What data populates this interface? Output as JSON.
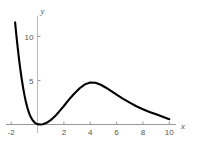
{
  "chart_data": {
    "type": "line",
    "title": "",
    "subtitle": "",
    "xlabel": "x",
    "ylabel": "y",
    "xlim": [
      -2.1,
      10.6
    ],
    "ylim": [
      -0.9,
      12.6
    ],
    "grid": false,
    "legend": null,
    "x_ticks": [
      {
        "value": -2,
        "label": "-2"
      },
      {
        "value": 2,
        "label": "2"
      },
      {
        "value": 4,
        "label": "4"
      },
      {
        "value": 6,
        "label": "6"
      },
      {
        "value": 8,
        "label": "8"
      },
      {
        "value": 10,
        "label": "10"
      }
    ],
    "y_ticks": [
      {
        "value": 5,
        "label": "5"
      },
      {
        "value": 10,
        "label": "10"
      }
    ],
    "series": [
      {
        "name": "curve",
        "color": "#000000",
        "line_width": 2.1,
        "x": [
          -1.7,
          -1.6,
          -1.5,
          -1.4,
          -1.3,
          -1.2,
          -1.1,
          -1.0,
          -0.9,
          -0.8,
          -0.7,
          -0.6,
          -0.5,
          -0.4,
          -0.3,
          -0.2,
          -0.1,
          0.0,
          0.2,
          0.4,
          0.6,
          0.8,
          1.0,
          1.2,
          1.4,
          1.6,
          1.8,
          2.0,
          2.4,
          2.8,
          3.2,
          3.6,
          4.0,
          4.4,
          4.8,
          5.2,
          5.6,
          6.0,
          6.5,
          7.0,
          7.5,
          8.0,
          8.5,
          9.0,
          9.5,
          10.0
        ],
        "y": [
          11.6,
          10.1,
          8.7,
          7.4,
          6.25,
          5.2,
          4.25,
          3.42,
          2.7,
          2.08,
          1.57,
          1.15,
          0.82,
          0.56,
          0.36,
          0.21,
          0.1,
          0.04,
          0.0,
          0.03,
          0.13,
          0.29,
          0.5,
          0.76,
          1.06,
          1.39,
          1.74,
          2.1,
          2.85,
          3.53,
          4.12,
          4.56,
          4.78,
          4.74,
          4.52,
          4.18,
          3.8,
          3.4,
          2.92,
          2.48,
          2.08,
          1.74,
          1.43,
          1.16,
          0.88,
          0.6
        ]
      }
    ],
    "axes": {
      "x_axis_color": "#999999",
      "y_axis_color": "#bbbbbb",
      "tick_color": "#999999"
    }
  }
}
